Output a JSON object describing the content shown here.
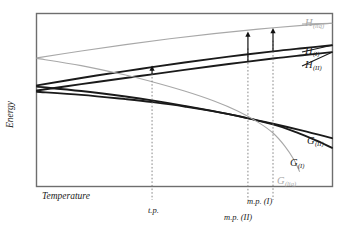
{
  "figure": {
    "type": "thermodynamic-energy-diagram",
    "background_color": "#ffffff",
    "frame_color": "#6e6e6e"
  },
  "axes": {
    "x_label": "Temperature",
    "y_label": "Energy",
    "x_ticks_shown": false,
    "y_ticks_shown": false,
    "grid": false
  },
  "tick_labels": [
    {
      "name": "triple-point",
      "text": "t.p.",
      "x": 148,
      "y": 206
    },
    {
      "name": "melting-point-one",
      "text": "m.p. (I)",
      "x": 247,
      "y": 197
    },
    {
      "name": "melting-point-two",
      "text": "m.p. (II)",
      "x": 224,
      "y": 213
    }
  ],
  "curve_labels": [
    {
      "name": "h-liquid",
      "base": "H",
      "sub": "(liq)",
      "color": "#a8a8a8",
      "x": 305,
      "y": 18
    },
    {
      "name": "h-phase-one",
      "base": "H",
      "sub": "(I)",
      "color": "#1a1a1a",
      "x": 305,
      "y": 46
    },
    {
      "name": "h-phase-two",
      "base": "H",
      "sub": "(II)",
      "color": "#1a1a1a",
      "x": 305,
      "y": 60
    },
    {
      "name": "g-phase-two",
      "base": "G",
      "sub": "(II)",
      "color": "#1a1a1a",
      "x": 307,
      "y": 136
    },
    {
      "name": "g-phase-one",
      "base": "G",
      "sub": "(I)",
      "color": "#1a1a1a",
      "x": 290,
      "y": 158
    },
    {
      "name": "g-liquid",
      "base": "G",
      "sub": "(liq)",
      "color": "#a8a8a8",
      "x": 277,
      "y": 176
    }
  ],
  "chart_data": {
    "type": "line",
    "title": "",
    "xlabel": "Temperature",
    "ylabel": "Energy",
    "xlim": [
      0,
      1
    ],
    "ylim": [
      0,
      1
    ],
    "grid": false,
    "legend_position": "inline-right",
    "annotations": [
      {
        "label": "t.p.",
        "type": "vertical-dashed-marker",
        "x_norm": 0.39
      },
      {
        "label": "m.p. (II)",
        "type": "vertical-dashed-marker",
        "x_norm": 0.715
      },
      {
        "label": "m.p. (I)",
        "type": "vertical-dashed-marker",
        "x_norm": 0.8
      },
      {
        "label": "transition-enthalpy-arrow",
        "type": "up-arrow",
        "x_norm": 0.39
      },
      {
        "label": "enthalpy-of-fusion-II-arrow",
        "type": "up-arrow",
        "x_norm": 0.715
      },
      {
        "label": "enthalpy-of-fusion-I-arrow",
        "type": "up-arrow",
        "x_norm": 0.8
      }
    ],
    "series": [
      {
        "name": "H(liq)",
        "color": "#a8a8a8",
        "width": 1.1,
        "points": [
          [
            0.0,
            0.745
          ],
          [
            0.15,
            0.785
          ],
          [
            0.3,
            0.822
          ],
          [
            0.45,
            0.856
          ],
          [
            0.6,
            0.886
          ],
          [
            0.75,
            0.912
          ],
          [
            0.9,
            0.934
          ],
          [
            1.0,
            0.946
          ]
        ]
      },
      {
        "name": "H(I)",
        "color": "#1a1a1a",
        "width": 1.9,
        "points": [
          [
            0.0,
            0.585
          ],
          [
            0.15,
            0.628
          ],
          [
            0.3,
            0.668
          ],
          [
            0.39,
            0.691
          ],
          [
            0.5,
            0.718
          ],
          [
            0.65,
            0.752
          ],
          [
            0.8,
            0.783
          ],
          [
            0.9,
            0.801
          ],
          [
            1.0,
            0.818
          ]
        ]
      },
      {
        "name": "H(II)",
        "color": "#1a1a1a",
        "width": 1.9,
        "points": [
          [
            0.0,
            0.555
          ],
          [
            0.15,
            0.592
          ],
          [
            0.3,
            0.628
          ],
          [
            0.39,
            0.649
          ],
          [
            0.5,
            0.675
          ],
          [
            0.65,
            0.709
          ],
          [
            0.8,
            0.741
          ],
          [
            0.9,
            0.76
          ],
          [
            1.0,
            0.778
          ]
        ]
      },
      {
        "name": "G(II)",
        "color": "#1a1a1a",
        "width": 1.9,
        "points": [
          [
            0.0,
            0.578
          ],
          [
            0.15,
            0.552
          ],
          [
            0.3,
            0.52
          ],
          [
            0.39,
            0.498
          ],
          [
            0.5,
            0.466
          ],
          [
            0.65,
            0.418
          ],
          [
            0.8,
            0.362
          ],
          [
            0.9,
            0.322
          ],
          [
            1.0,
            0.278
          ]
        ]
      },
      {
        "name": "G(I)",
        "color": "#1a1a1a",
        "width": 1.9,
        "points": [
          [
            0.0,
            0.548
          ],
          [
            0.15,
            0.53
          ],
          [
            0.3,
            0.505
          ],
          [
            0.39,
            0.488
          ],
          [
            0.5,
            0.462
          ],
          [
            0.65,
            0.418
          ],
          [
            0.8,
            0.358
          ],
          [
            0.88,
            0.312
          ],
          [
            0.95,
            0.262
          ],
          [
            1.0,
            0.222
          ]
        ]
      },
      {
        "name": "G(liq)",
        "color": "#a8a8a8",
        "width": 1.1,
        "points": [
          [
            0.0,
            0.742
          ],
          [
            0.15,
            0.7
          ],
          [
            0.3,
            0.645
          ],
          [
            0.39,
            0.606
          ],
          [
            0.5,
            0.552
          ],
          [
            0.6,
            0.494
          ],
          [
            0.68,
            0.436
          ],
          [
            0.75,
            0.37
          ],
          [
            0.8,
            0.308
          ],
          [
            0.84,
            0.232
          ],
          [
            0.87,
            0.155
          ],
          [
            0.89,
            0.085
          ]
        ]
      }
    ]
  }
}
